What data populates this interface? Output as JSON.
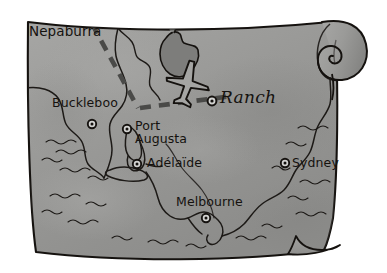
{
  "map": {
    "title_region": "Nepaburra",
    "destination": {
      "label": "Ranch",
      "marker": "destination-marker"
    },
    "cities": [
      {
        "name": "Buckleboo",
        "marker": "city-marker"
      },
      {
        "name": "Port",
        "name2": "Augusta",
        "marker": "city-marker"
      },
      {
        "name": "Adélaïde",
        "marker": "city-marker"
      },
      {
        "name": "Melbourne",
        "marker": "city-marker"
      },
      {
        "name": "Sydney",
        "marker": "city-marker"
      }
    ],
    "route": {
      "style": "dashed",
      "vehicle_icon": "airplane-icon"
    },
    "icons": {
      "scroll_curl": "scroll-curl-icon",
      "waves": "ocean-wave-icon",
      "lake": "lake-shape"
    },
    "colors": {
      "paper": "#9b9b99",
      "paper_dark": "#8a8a88",
      "paper_light": "#adadab",
      "ink": "#15120f",
      "route": "#4b4b49",
      "lake": "#7c7c7a",
      "background": "#ffffff"
    }
  }
}
